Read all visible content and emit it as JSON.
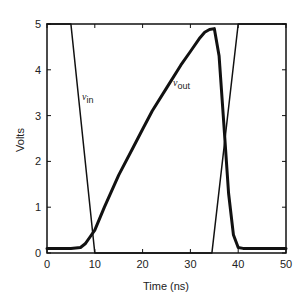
{
  "chart_data": {
    "type": "line",
    "title": "",
    "xlabel": "Time (ns)",
    "ylabel": "Volts",
    "xlim": [
      0,
      50
    ],
    "ylim": [
      0,
      5
    ],
    "xticks": [
      0,
      10,
      20,
      30,
      40,
      50
    ],
    "yticks": [
      0,
      1,
      2,
      3,
      4,
      5
    ],
    "grid": false,
    "legend": "inline labels",
    "series": [
      {
        "name": "v_in",
        "label_main": "v",
        "label_sub": "in",
        "line_width": 1.5,
        "x": [
          0,
          5,
          10,
          34.5,
          40,
          50
        ],
        "y": [
          5,
          5,
          0,
          0,
          5,
          5
        ]
      },
      {
        "name": "v_out",
        "label_main": "v",
        "label_sub": "out",
        "line_width": 3,
        "x": [
          0,
          5,
          7,
          8,
          9,
          10,
          12,
          15,
          18,
          20,
          22,
          25,
          28,
          30,
          32,
          33,
          34,
          35,
          36,
          37,
          38,
          39,
          40,
          41,
          45,
          50
        ],
        "y": [
          0.1,
          0.1,
          0.12,
          0.2,
          0.35,
          0.5,
          1.0,
          1.7,
          2.3,
          2.7,
          3.1,
          3.6,
          4.1,
          4.4,
          4.7,
          4.82,
          4.88,
          4.9,
          4.3,
          2.8,
          1.3,
          0.4,
          0.12,
          0.1,
          0.1,
          0.1
        ]
      }
    ]
  }
}
